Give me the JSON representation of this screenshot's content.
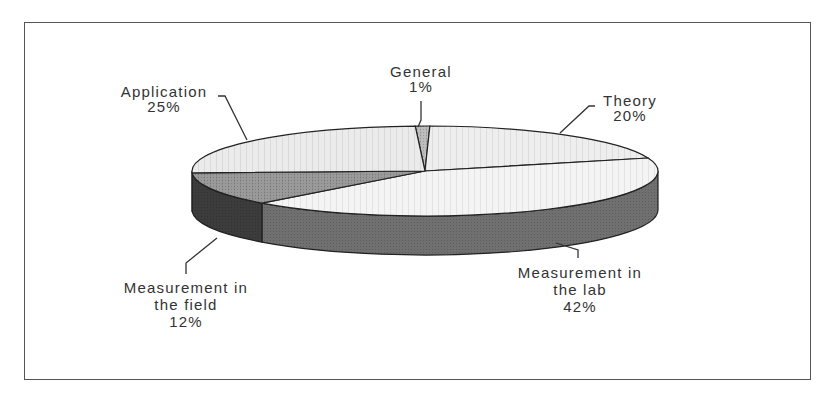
{
  "chart_data": {
    "type": "pie",
    "style": "3d-exploded-none",
    "title": "",
    "slices": [
      {
        "name": "General",
        "label_lines": [
          "General"
        ],
        "value": 1,
        "pct_label": "1%",
        "top_color": "#bdbdbd",
        "side_color": "#8a8a8a"
      },
      {
        "name": "Theory",
        "label_lines": [
          "Theory"
        ],
        "value": 20,
        "pct_label": "20%",
        "top_color": "#eeeeee",
        "side_color": "#6a6a6a"
      },
      {
        "name": "Measurement in the lab",
        "label_lines": [
          "Measurement in",
          "the lab"
        ],
        "value": 42,
        "pct_label": "42%",
        "top_color": "#f4f4f4",
        "side_color": "#707070"
      },
      {
        "name": "Measurement in the field",
        "label_lines": [
          "Measurement in",
          "the field"
        ],
        "value": 12,
        "pct_label": "12%",
        "top_color": "#9a9a9a",
        "side_color": "#3c3c3c"
      },
      {
        "name": "Application",
        "label_lines": [
          "Application"
        ],
        "value": 25,
        "pct_label": "25%",
        "top_color": "#ebebeb",
        "side_color": "#6a6a6a"
      }
    ],
    "legend": "none",
    "data_labels": "category name and percentage with leader lines"
  },
  "labels": {
    "general": {
      "line1": "General",
      "line2": "1%"
    },
    "theory": {
      "line1": "Theory",
      "line2": "20%"
    },
    "lab": {
      "line1": "Measurement in",
      "line2": "the lab",
      "line3": "42%"
    },
    "field": {
      "line1": "Measurement in",
      "line2": "the field",
      "line3": "12%"
    },
    "application": {
      "line1": "Application",
      "line2": "25%"
    }
  }
}
